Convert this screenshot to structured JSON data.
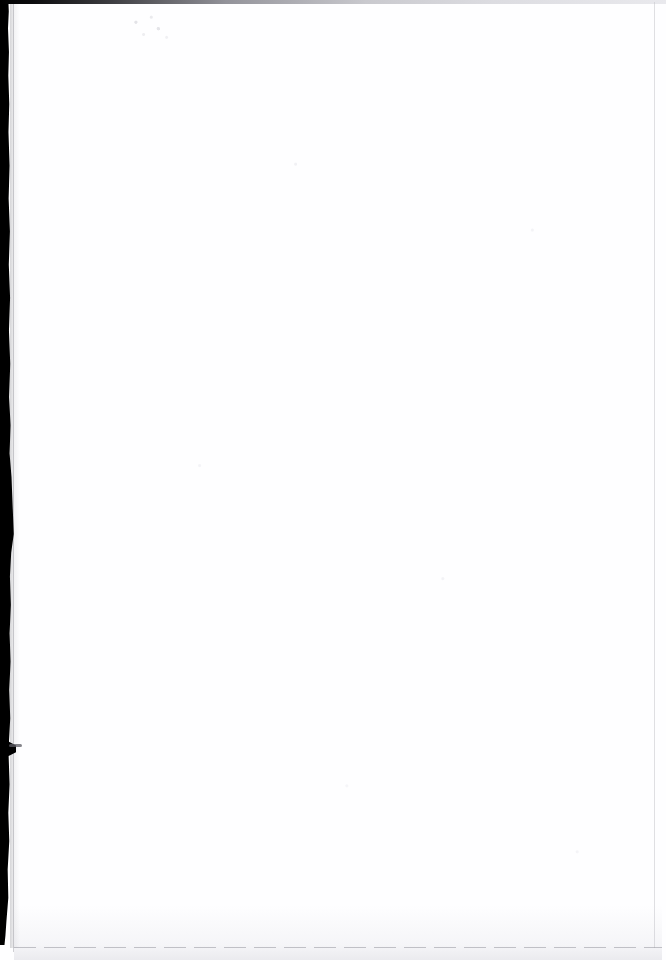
{
  "document": {
    "page_type": "scanned-page",
    "page_content": "",
    "is_blank": true,
    "visible_text": "",
    "background_color": "#fefeff",
    "artifact_color": "#000000"
  },
  "artifacts": {
    "gutter_shadow": {
      "name": "binding-gutter-shadow",
      "edge": "left",
      "color": "#000000"
    },
    "top_edge_band": {
      "name": "top-edge-band",
      "edge": "top",
      "color": "#000000"
    },
    "bottom_edge_rule": {
      "name": "bottom-edge-rule",
      "edge": "bottom",
      "color": "#96969e"
    },
    "right_edge_rule": {
      "name": "right-edge-rule",
      "edge": "right",
      "color": "#c4c4cb"
    },
    "speckles": {
      "name": "scanner-speckle",
      "color": "#cdcdd4"
    }
  }
}
